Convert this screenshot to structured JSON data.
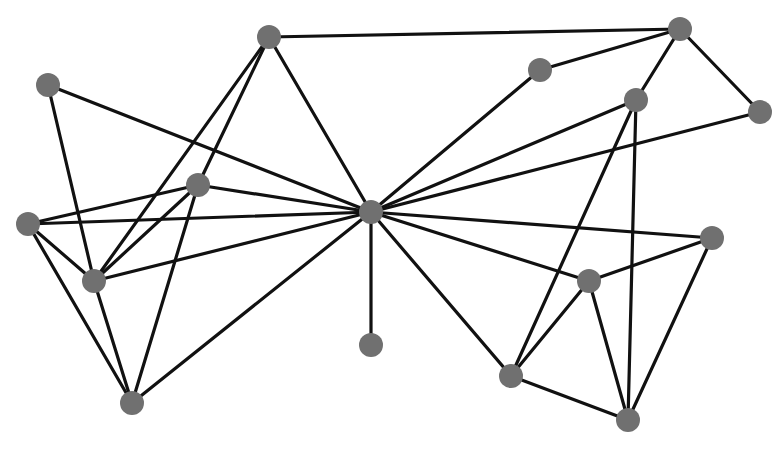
{
  "diagram": {
    "type": "network-graph",
    "colors": {
      "background": "#ffffff",
      "edge": "#111111",
      "node": "#707070"
    },
    "node_radius": 12,
    "nodes": [
      {
        "id": "A",
        "x": 269,
        "y": 37
      },
      {
        "id": "B",
        "x": 48,
        "y": 85
      },
      {
        "id": "C",
        "x": 198,
        "y": 185
      },
      {
        "id": "D",
        "x": 28,
        "y": 224
      },
      {
        "id": "E",
        "x": 94,
        "y": 281
      },
      {
        "id": "F",
        "x": 132,
        "y": 403
      },
      {
        "id": "H",
        "x": 371,
        "y": 212
      },
      {
        "id": "I",
        "x": 371,
        "y": 345
      },
      {
        "id": "J",
        "x": 680,
        "y": 29
      },
      {
        "id": "K",
        "x": 540,
        "y": 70
      },
      {
        "id": "L",
        "x": 636,
        "y": 100
      },
      {
        "id": "M",
        "x": 760,
        "y": 112
      },
      {
        "id": "N",
        "x": 712,
        "y": 238
      },
      {
        "id": "O",
        "x": 589,
        "y": 281
      },
      {
        "id": "P",
        "x": 511,
        "y": 376
      },
      {
        "id": "Q",
        "x": 628,
        "y": 420
      }
    ],
    "edges": [
      [
        "A",
        "J"
      ],
      [
        "A",
        "E"
      ],
      [
        "A",
        "C"
      ],
      [
        "A",
        "H"
      ],
      [
        "B",
        "E"
      ],
      [
        "B",
        "H"
      ],
      [
        "C",
        "D"
      ],
      [
        "C",
        "H"
      ],
      [
        "C",
        "E"
      ],
      [
        "C",
        "F"
      ],
      [
        "D",
        "H"
      ],
      [
        "D",
        "E"
      ],
      [
        "D",
        "F"
      ],
      [
        "E",
        "H"
      ],
      [
        "E",
        "F"
      ],
      [
        "F",
        "H"
      ],
      [
        "H",
        "I"
      ],
      [
        "H",
        "K"
      ],
      [
        "H",
        "L"
      ],
      [
        "H",
        "M"
      ],
      [
        "H",
        "N"
      ],
      [
        "H",
        "O"
      ],
      [
        "H",
        "P"
      ],
      [
        "K",
        "J"
      ],
      [
        "J",
        "M"
      ],
      [
        "J",
        "L"
      ],
      [
        "L",
        "P"
      ],
      [
        "L",
        "Q"
      ],
      [
        "N",
        "O"
      ],
      [
        "N",
        "Q"
      ],
      [
        "O",
        "P"
      ],
      [
        "O",
        "Q"
      ],
      [
        "P",
        "Q"
      ]
    ]
  }
}
